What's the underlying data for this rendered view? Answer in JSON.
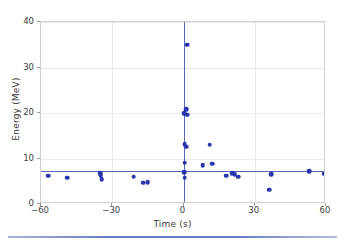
{
  "chart_data": {
    "type": "scatter",
    "title": "",
    "xlabel": "Time (s)",
    "ylabel": "Energy (MeV)",
    "xlim": [
      -60,
      60
    ],
    "ylim": [
      0,
      40
    ],
    "xticks": [
      -60,
      -30,
      0,
      30,
      60
    ],
    "xtick_labels": [
      "−60",
      "−30",
      "0",
      "30",
      "60"
    ],
    "yticks": [
      0,
      10,
      20,
      30,
      40
    ],
    "ytick_labels": [
      "0",
      "10",
      "20",
      "30",
      "40"
    ],
    "grid": true,
    "grid_axis": "both",
    "legend": null,
    "marker_color": "#2b35ad",
    "marker_size": 4.6,
    "reference_lines": [
      {
        "name": "horizontal-mean-line",
        "orientation": "horizontal",
        "value": 7.2,
        "color": "#5566bb"
      },
      {
        "name": "vertical-trigger-line",
        "orientation": "vertical",
        "value": 0,
        "color": "#5566bb"
      }
    ],
    "points": [
      {
        "x": -57.0,
        "y": 6.2
      },
      {
        "x": -49.0,
        "y": 5.8
      },
      {
        "x": -35.0,
        "y": 6.8
      },
      {
        "x": -34.8,
        "y": 6.3
      },
      {
        "x": -34.5,
        "y": 5.5
      },
      {
        "x": -21.0,
        "y": 6.0
      },
      {
        "x": -17.0,
        "y": 4.7
      },
      {
        "x": -15.0,
        "y": 4.8
      },
      {
        "x": 1.5,
        "y": 35.0
      },
      {
        "x": 1.2,
        "y": 20.8
      },
      {
        "x": 0.4,
        "y": 20.0
      },
      {
        "x": 1.6,
        "y": 19.6
      },
      {
        "x": 0.5,
        "y": 13.2
      },
      {
        "x": 1.1,
        "y": 12.6
      },
      {
        "x": 0.5,
        "y": 9.1
      },
      {
        "x": 0.4,
        "y": 7.0
      },
      {
        "x": 0.5,
        "y": 5.8
      },
      {
        "x": 8.0,
        "y": 8.5
      },
      {
        "x": 11.0,
        "y": 13.0
      },
      {
        "x": 12.0,
        "y": 8.9
      },
      {
        "x": 18.0,
        "y": 6.2
      },
      {
        "x": 20.5,
        "y": 6.8
      },
      {
        "x": 21.5,
        "y": 6.6
      },
      {
        "x": 23.0,
        "y": 6.0
      },
      {
        "x": 36.0,
        "y": 3.1
      },
      {
        "x": 37.0,
        "y": 6.6
      },
      {
        "x": 53.0,
        "y": 7.2
      },
      {
        "x": 59.0,
        "y": 6.7
      }
    ]
  }
}
